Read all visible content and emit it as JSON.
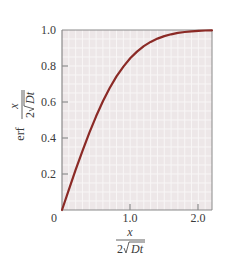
{
  "chart_data": {
    "type": "line",
    "title": "",
    "xlabel": "x / (2√Dt)",
    "ylabel": "erf x / (2√Dt)",
    "xlim": [
      0,
      2.2
    ],
    "ylim": [
      0,
      1.0
    ],
    "grid": true,
    "x_ticks": [
      "0",
      "1.0",
      "2.0"
    ],
    "y_ticks": [
      "0.2",
      "0.4",
      "0.6",
      "0.8",
      "1.0"
    ],
    "series": [
      {
        "name": "erf",
        "color": "#8b2a26",
        "x": [
          0,
          0.1,
          0.2,
          0.3,
          0.4,
          0.5,
          0.6,
          0.7,
          0.8,
          0.9,
          1.0,
          1.1,
          1.2,
          1.3,
          1.4,
          1.5,
          1.6,
          1.7,
          1.8,
          1.9,
          2.0,
          2.1,
          2.2
        ],
        "values": [
          0,
          0.1125,
          0.2227,
          0.3286,
          0.4284,
          0.5205,
          0.6039,
          0.6778,
          0.7421,
          0.7969,
          0.8427,
          0.8802,
          0.9103,
          0.934,
          0.9523,
          0.9661,
          0.9763,
          0.9838,
          0.9891,
          0.9928,
          0.9953,
          0.997,
          0.9981
        ]
      }
    ]
  },
  "labels": {
    "origin": "0",
    "x_tick_1": "1.0",
    "x_tick_2": "2.0",
    "y_tick_02": "0.2",
    "y_tick_04": "0.4",
    "y_tick_06": "0.6",
    "y_tick_08": "0.8",
    "y_tick_10": "1.0",
    "x_numer": "x",
    "x_denom_2": "2",
    "x_denom_Dt": "Dt",
    "y_erf": "erf",
    "y_numer": "x",
    "y_denom_2": "2",
    "y_denom_Dt": "Dt"
  },
  "colors": {
    "plot_bg": "#ede7e8",
    "grid": "#f8f6f6",
    "axis": "#8a8a8a",
    "curve": "#8b2a26"
  }
}
